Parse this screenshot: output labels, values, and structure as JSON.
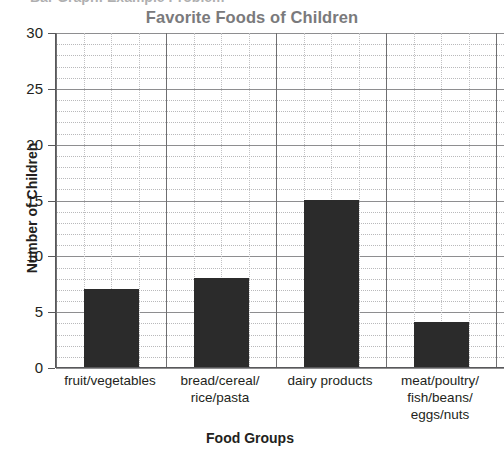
{
  "header": {
    "clipped_line": "Bar Graph: Example Problem"
  },
  "chart_data": {
    "type": "bar",
    "title": "Favorite Foods of Children",
    "xlabel": "Food Groups",
    "ylabel": "Number of Children",
    "categories": [
      "fruit/vegetables",
      "bread/cereal/ rice/pasta",
      "dairy products",
      "meat/poultry/ fish/beans/ eggs/nuts"
    ],
    "category_lines": [
      [
        "fruit/vegetables"
      ],
      [
        "bread/cereal/",
        "rice/pasta"
      ],
      [
        "dairy products"
      ],
      [
        "meat/poultry/",
        "fish/beans/",
        "eggs/nuts"
      ]
    ],
    "values": [
      7,
      8,
      15,
      4
    ],
    "ylim": [
      0,
      30
    ],
    "ytick_labels": [
      "0",
      "5",
      "10",
      "15",
      "20",
      "25",
      "30"
    ],
    "ytick_values": [
      0,
      5,
      10,
      15,
      20,
      25,
      30
    ],
    "minor_tick_step": 1,
    "grid": true,
    "legend": "none",
    "bar_color": "#2b2b2b",
    "title_color": "#7a7a7c",
    "axis_color": "#58585a",
    "major_grid_color": "#8e8e90",
    "minor_grid_color": "#b9b9bb"
  }
}
